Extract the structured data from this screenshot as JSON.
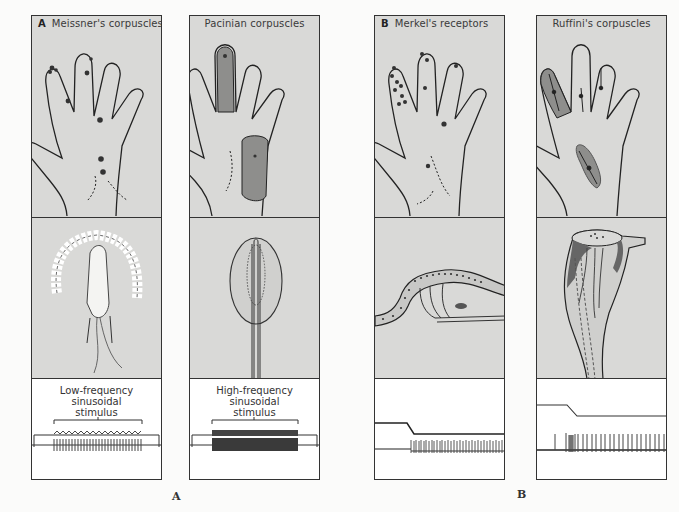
{
  "colors": {
    "panel_fill": "#d9d9d7",
    "shaded_region": "#8e8e8c",
    "outline": "#333333",
    "background": "#fbfbfa"
  },
  "figure_labels": {
    "group_a": "A",
    "group_b": "B"
  },
  "panels": [
    {
      "id": "meissner",
      "group_letter": "A",
      "title": "Meissner's corpuscles",
      "receptive_field": "small-dots",
      "anatomy": "meissner-corpuscle-drawing",
      "stimulus_label": [
        "Low-frequency",
        "sinusoidal",
        "stimulus"
      ],
      "response": "rapidly-adapting-low-frequency"
    },
    {
      "id": "pacinian",
      "group_letter": "",
      "title": "Pacinian corpuscles",
      "receptive_field": "large-shaded-areas",
      "anatomy": "pacinian-corpuscle-drawing",
      "stimulus_label": [
        "High-frequency",
        "sinusoidal",
        "stimulus"
      ],
      "response": "rapidly-adapting-high-frequency"
    },
    {
      "id": "merkel",
      "group_letter": "B",
      "title": "Merkel's receptors",
      "receptive_field": "small-dots",
      "anatomy": "merkel-receptor-drawing",
      "stimulus_label": [],
      "response": "slowly-adapting-irregular"
    },
    {
      "id": "ruffini",
      "group_letter": "",
      "title": "Ruffini's corpuscles",
      "receptive_field": "large-shaded-areas-with-arrows",
      "anatomy": "ruffini-corpuscle-drawing",
      "stimulus_label": [],
      "response": "slowly-adapting-regular"
    }
  ]
}
